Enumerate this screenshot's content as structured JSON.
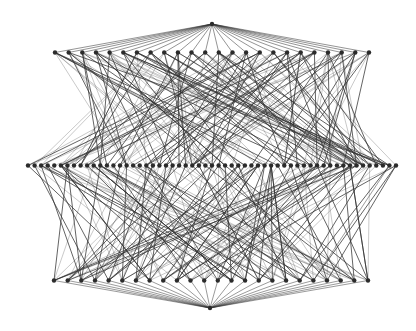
{
  "diagram": {
    "type": "layered-graph",
    "background": "#ffffff",
    "node_color": "#2b2b2b",
    "edge_color": "#333333",
    "node_radius": 2.2,
    "layers": [
      {
        "name": "top-apex",
        "count": 1,
        "y": 24,
        "x_start": 212,
        "x_end": 212
      },
      {
        "name": "top-row",
        "count": 24,
        "y": 52.5,
        "x_start": 55,
        "x_end": 369
      },
      {
        "name": "middle-row",
        "count": 57,
        "y": 165.5,
        "x_start": 28,
        "x_end": 396
      },
      {
        "name": "bottom-row",
        "count": 24,
        "y": 280.5,
        "x_start": 54,
        "x_end": 368
      },
      {
        "name": "bottom-apex",
        "count": 1,
        "y": 308,
        "x_start": 210,
        "x_end": 210
      }
    ],
    "connections": {
      "apex_to_row": "all",
      "row_to_middle_edges_per_node": 7,
      "seed": 1337
    },
    "labels": []
  }
}
